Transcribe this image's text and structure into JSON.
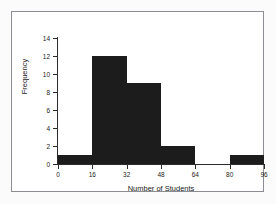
{
  "chart_data": {
    "type": "bar",
    "title": "",
    "xlabel": "Number of Students",
    "ylabel": "Frequency",
    "categories": [
      "0-16",
      "16-32",
      "32-48",
      "48-64",
      "64-80",
      "80-96"
    ],
    "bin_edges": [
      0,
      16,
      32,
      48,
      64,
      80,
      96
    ],
    "values": [
      1,
      12,
      9,
      2,
      0,
      1
    ],
    "xlim": [
      0,
      96
    ],
    "ylim": [
      0,
      14
    ],
    "xticks": [
      0,
      16,
      32,
      48,
      64,
      80,
      96
    ],
    "xtick_labels": [
      "0",
      "16",
      "32",
      "48",
      "64",
      "80",
      "96"
    ],
    "yticks": [
      0,
      2,
      4,
      6,
      8,
      10,
      12,
      14
    ],
    "ytick_labels": [
      "0",
      "2",
      "4",
      "6",
      "8",
      "10",
      "12",
      "14"
    ],
    "grid": false,
    "legend": null,
    "bar_color": "#1c1c1c",
    "axis_color": "#2b2b2b",
    "frame_color": "#8b8d93",
    "plot_background": "#ffffff",
    "figure_background": "#fbfbfb"
  }
}
